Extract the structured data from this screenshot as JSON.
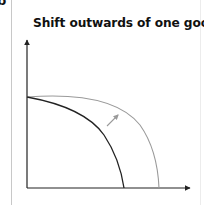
{
  "page": {
    "corner_glyph": "b",
    "title": "Shift outwards of one good"
  },
  "diagram": {
    "type": "production-possibility-frontier",
    "axes": {
      "x_label": "",
      "y_label": "",
      "origin": [
        27,
        188
      ],
      "y_axis_top": [
        27,
        38
      ],
      "x_axis_right": [
        190,
        188
      ],
      "color": "#222222"
    },
    "curves": [
      {
        "name": "original-ppf",
        "color": "#222222",
        "y_intercept": [
          27,
          97
        ],
        "x_intercept": [
          124,
          188
        ]
      },
      {
        "name": "shifted-ppf",
        "color": "#9a9a9a",
        "y_intercept": [
          27,
          97
        ],
        "x_intercept": [
          159,
          188
        ]
      }
    ],
    "shift_arrow": {
      "from": [
        107,
        126
      ],
      "to": [
        118,
        115
      ],
      "color": "#9a9a9a"
    }
  }
}
